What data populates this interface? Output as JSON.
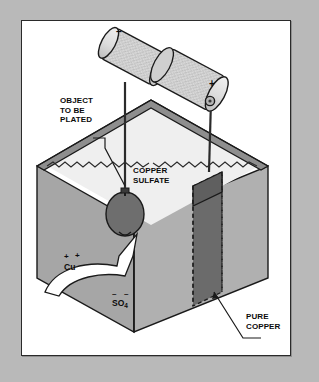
{
  "figure": {
    "background_color": "#b9b9b9",
    "panel_color": "#ffffff",
    "frame_color": "#2a2a2a"
  },
  "labels": {
    "object_to_be_plated": "OBJECT\nTO BE\nPLATED",
    "copper_sulfate": "COPPER\nSULFATE",
    "pure_copper": "PURE\nCOPPER"
  },
  "ions": {
    "copper": "Cu",
    "copper_charge_1": "+",
    "copper_charge_2": "+",
    "sulfate": "SO",
    "sulfate_subscript": "4",
    "sulfate_charge_1": "–",
    "sulfate_charge_2": "–"
  },
  "battery": {
    "negative_terminal": "–",
    "positive_terminal": "+",
    "body_color": "#d8d8d8",
    "outline_color": "#1a1a1a"
  },
  "tank": {
    "left_wall_color": "#a6a6a6",
    "right_wall_color": "#b0b0b0",
    "rim_color": "#8e8e8e",
    "liquid_color": "#efefef",
    "outline_color": "#1a1a1a"
  },
  "electrodes": {
    "plated_object_color": "#6e6e6e",
    "copper_plate_color": "#666666",
    "wire_color": "#2b2b2b"
  }
}
